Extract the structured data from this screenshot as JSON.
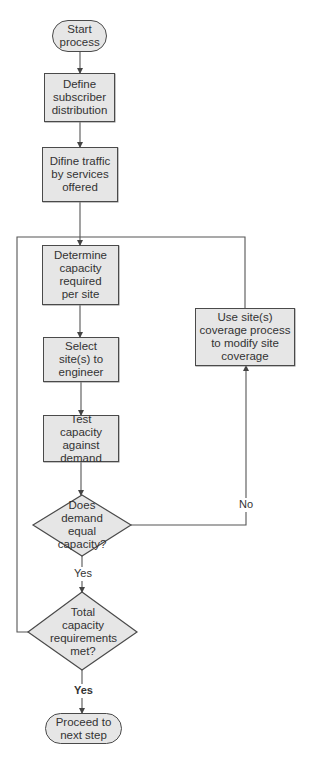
{
  "flowchart": {
    "nodes": [
      {
        "id": "start",
        "type": "terminal",
        "label": "Start process"
      },
      {
        "id": "define_subscriber",
        "type": "process",
        "label": "Define subscriber distribution"
      },
      {
        "id": "define_traffic",
        "type": "process",
        "label": "Difine traffic by services offered"
      },
      {
        "id": "determine_capacity",
        "type": "process",
        "label": "Determine capacity required per site"
      },
      {
        "id": "select_sites",
        "type": "process",
        "label": "Select site(s) to engineer"
      },
      {
        "id": "test_capacity",
        "type": "process",
        "label": "Test capacity against demand"
      },
      {
        "id": "demand_equal",
        "type": "decision",
        "label": "Does demand equal capacity?"
      },
      {
        "id": "total_met",
        "type": "decision",
        "label": "Total capacity requirements met?"
      },
      {
        "id": "proceed",
        "type": "terminal",
        "label": "Proceed to next step"
      },
      {
        "id": "modify_coverage",
        "type": "process",
        "label": "Use site(s) coverage process to modify site coverage"
      }
    ],
    "edge_labels": {
      "no": "No",
      "yes1": "Yes",
      "yes2": "Yes"
    },
    "edges": [
      {
        "from": "start",
        "to": "define_subscriber"
      },
      {
        "from": "define_subscriber",
        "to": "define_traffic"
      },
      {
        "from": "define_traffic",
        "to": "determine_capacity"
      },
      {
        "from": "determine_capacity",
        "to": "select_sites"
      },
      {
        "from": "select_sites",
        "to": "test_capacity"
      },
      {
        "from": "test_capacity",
        "to": "demand_equal"
      },
      {
        "from": "demand_equal",
        "to": "total_met",
        "label": "Yes"
      },
      {
        "from": "demand_equal",
        "to": "modify_coverage",
        "label": "No"
      },
      {
        "from": "modify_coverage",
        "to": "determine_capacity"
      },
      {
        "from": "total_met",
        "to": "determine_capacity",
        "label": "No (loop)"
      },
      {
        "from": "total_met",
        "to": "proceed",
        "label": "Yes"
      }
    ],
    "colors": {
      "fill": "#e6e6e6",
      "stroke": "#4a4a4a",
      "text": "#333333",
      "connector": "#555555"
    }
  }
}
